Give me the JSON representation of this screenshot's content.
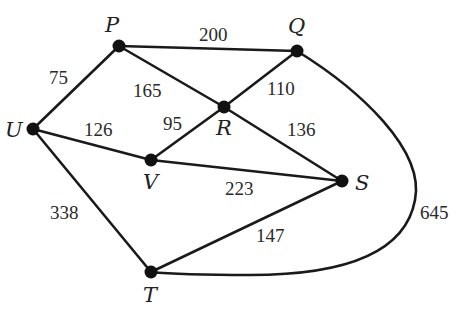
{
  "diagram": {
    "type": "weighted-undirected-graph",
    "nodes": [
      {
        "id": "P",
        "label": "P",
        "x": 119,
        "y": 46,
        "lx": 112,
        "ly": 32
      },
      {
        "id": "Q",
        "label": "Q",
        "x": 297,
        "y": 51,
        "lx": 290,
        "ly": 34
      },
      {
        "id": "U",
        "label": "U",
        "x": 33,
        "y": 129,
        "lx": 6,
        "ly": 137
      },
      {
        "id": "R",
        "label": "R",
        "x": 224,
        "y": 107,
        "lx": 213,
        "ly": 135
      },
      {
        "id": "V",
        "label": "V",
        "x": 151,
        "y": 160,
        "lx": 143,
        "ly": 188
      },
      {
        "id": "S",
        "label": "S",
        "x": 342,
        "y": 181,
        "lx": 355,
        "ly": 189
      },
      {
        "id": "T",
        "label": "T",
        "x": 151,
        "y": 272,
        "lx": 143,
        "ly": 301
      }
    ],
    "edges": [
      {
        "from": "P",
        "to": "Q",
        "weight": "200",
        "wx": 199,
        "wy": 41
      },
      {
        "from": "U",
        "to": "P",
        "weight": "75",
        "wx": 49,
        "wy": 84
      },
      {
        "from": "P",
        "to": "R",
        "weight": "165",
        "wx": 133,
        "wy": 97
      },
      {
        "from": "Q",
        "to": "R",
        "weight": "110",
        "wx": 267,
        "wy": 95
      },
      {
        "from": "V",
        "to": "R",
        "weight": "95",
        "wx": 163,
        "wy": 130
      },
      {
        "from": "U",
        "to": "V",
        "weight": "126",
        "wx": 84,
        "wy": 136
      },
      {
        "from": "R",
        "to": "S",
        "weight": "136",
        "wx": 287,
        "wy": 136
      },
      {
        "from": "V",
        "to": "S",
        "weight": "223",
        "wx": 225,
        "wy": 195
      },
      {
        "from": "U",
        "to": "T",
        "weight": "338",
        "wx": 50,
        "wy": 219
      },
      {
        "from": "T",
        "to": "S",
        "weight": "147",
        "wx": 256,
        "wy": 242
      },
      {
        "from": "Q",
        "to": "T",
        "weight": "645",
        "wx": 420,
        "wy": 219,
        "curved": true
      }
    ]
  }
}
